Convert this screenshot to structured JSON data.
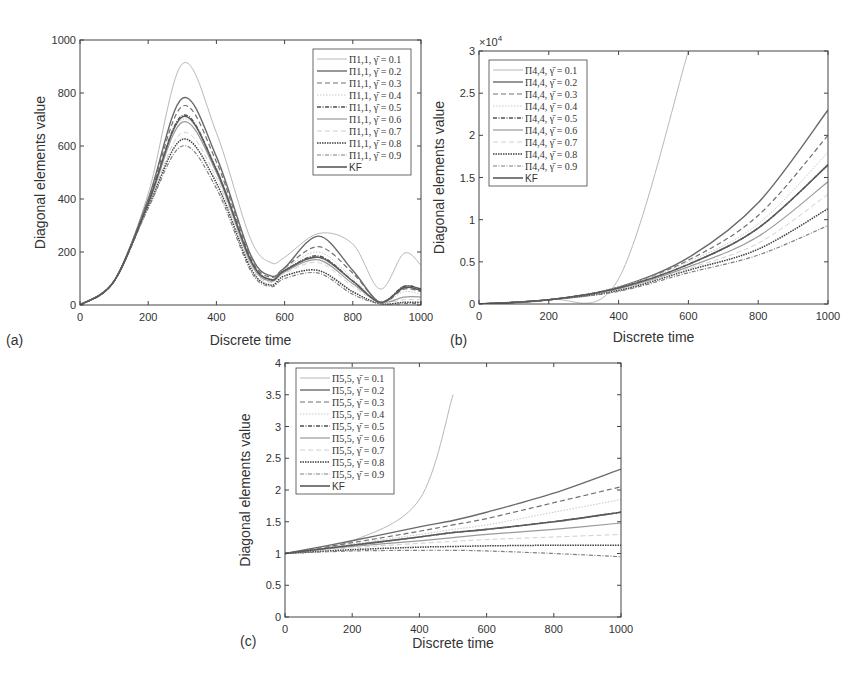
{
  "figure": {
    "panels": [
      {
        "id": "a",
        "label": "(a)",
        "xlabel": "Discrete time",
        "ylabel": "Diagonal elements value",
        "exponent": "",
        "xticks": [
          "0",
          "200",
          "400",
          "600",
          "800",
          "1000"
        ],
        "yticks": [
          "0",
          "200",
          "400",
          "600",
          "800",
          "1000"
        ],
        "legend": [
          "Π1,1, γ̄ = 0.1",
          "Π1,1, γ̄ = 0.2",
          "Π1,1, γ̄ = 0.3",
          "Π1,1, γ̄ = 0.4",
          "Π1,1, γ̄ = 0.5",
          "Π1,1, γ̄ = 0.6",
          "Π1,1, γ̄ = 0.7",
          "Π1,1, γ̄ = 0.8",
          "Π1,1, γ̄ = 0.9",
          "KF"
        ]
      },
      {
        "id": "b",
        "label": "(b)",
        "xlabel": "Discrete time",
        "ylabel": "Diagonal elements value",
        "exponent": "×10^4",
        "xticks": [
          "0",
          "200",
          "400",
          "600",
          "800",
          "1000"
        ],
        "yticks": [
          "0",
          "0.5",
          "1",
          "1.5",
          "2",
          "2.5",
          "3"
        ],
        "legend": [
          "Π4,4, γ̄ = 0.1",
          "Π4,4, γ̄ = 0.2",
          "Π4,4, γ̄ = 0.3",
          "Π4,4, γ̄ = 0.4",
          "Π4,4, γ̄ = 0.5",
          "Π4,4, γ̄ = 0.6",
          "Π4,4, γ̄ = 0.7",
          "Π4,4, γ̄ = 0.8",
          "Π4,4, γ̄ = 0.9",
          "KF"
        ]
      },
      {
        "id": "c",
        "label": "(c)",
        "xlabel": "Discrete time",
        "ylabel": "Diagonal elements value",
        "exponent": "",
        "xticks": [
          "0",
          "200",
          "400",
          "600",
          "800",
          "1000"
        ],
        "yticks": [
          "0",
          "0.5",
          "1",
          "1.5",
          "2",
          "2.5",
          "3",
          "3.5",
          "4"
        ],
        "legend": [
          "Π5,5, γ̄ = 0.1",
          "Π5,5, γ̄ = 0.2",
          "Π5,5, γ̄ = 0.3",
          "Π5,5, γ̄ = 0.4",
          "Π5,5, γ̄ = 0.5",
          "Π5,5, γ̄ = 0.6",
          "Π5,5, γ̄ = 0.7",
          "Π5,5, γ̄ = 0.8",
          "Π5,5, γ̄ = 0.9",
          "KF"
        ]
      }
    ]
  },
  "chart_data": [
    {
      "type": "line",
      "title": "(a)",
      "xlabel": "Discrete time",
      "ylabel": "Diagonal elements value",
      "xlim": [
        0,
        1000
      ],
      "ylim": [
        0,
        1000
      ],
      "grid": false,
      "legend_position": "upper right",
      "x": [
        0,
        100,
        200,
        300,
        400,
        500,
        560,
        600,
        700,
        800,
        880,
        950,
        1000
      ],
      "series": [
        {
          "name": "Π1,1, γ̄ = 0.1",
          "values": [
            0,
            90,
            420,
            910,
            650,
            250,
            160,
            180,
            270,
            230,
            60,
            195,
            150
          ]
        },
        {
          "name": "Π1,1, γ̄ = 0.2",
          "values": [
            0,
            90,
            400,
            780,
            560,
            190,
            110,
            140,
            260,
            130,
            10,
            70,
            60
          ]
        },
        {
          "name": "Π1,1, γ̄ = 0.3",
          "values": [
            0,
            90,
            395,
            750,
            540,
            180,
            105,
            140,
            220,
            120,
            10,
            60,
            50
          ]
        },
        {
          "name": "Π1,1, γ̄ = 0.4",
          "values": [
            0,
            90,
            390,
            700,
            520,
            170,
            100,
            135,
            200,
            100,
            10,
            50,
            40
          ]
        },
        {
          "name": "Π1,1, γ̄ = 0.5",
          "values": [
            0,
            90,
            385,
            715,
            510,
            170,
            95,
            130,
            185,
            90,
            10,
            70,
            60
          ]
        },
        {
          "name": "Π1,1, γ̄ = 0.6",
          "values": [
            0,
            90,
            380,
            690,
            500,
            160,
            90,
            125,
            170,
            80,
            10,
            30,
            30
          ]
        },
        {
          "name": "Π1,1, γ̄ = 0.7",
          "values": [
            0,
            90,
            375,
            650,
            480,
            150,
            85,
            120,
            160,
            70,
            10,
            20,
            20
          ]
        },
        {
          "name": "Π1,1, γ̄ = 0.8",
          "values": [
            0,
            90,
            370,
            625,
            460,
            140,
            75,
            110,
            130,
            50,
            5,
            10,
            10
          ]
        },
        {
          "name": "Π1,1, γ̄ = 0.9",
          "values": [
            0,
            90,
            365,
            600,
            440,
            130,
            70,
            100,
            120,
            40,
            5,
            5,
            5
          ]
        },
        {
          "name": "KF",
          "values": [
            0,
            90,
            385,
            710,
            510,
            170,
            95,
            130,
            180,
            90,
            10,
            65,
            55
          ]
        }
      ]
    },
    {
      "type": "line",
      "title": "(b)",
      "xlabel": "Discrete time",
      "ylabel": "Diagonal elements value",
      "y_scale": "×10^4",
      "xlim": [
        0,
        1000
      ],
      "ylim": [
        0,
        3
      ],
      "grid": false,
      "legend_position": "upper left",
      "x": [
        0,
        200,
        400,
        600,
        800,
        1000
      ],
      "series": [
        {
          "name": "Π4,4, γ̄ = 0.1",
          "values": [
            0,
            0.05,
            0.3,
            3.0,
            null,
            null
          ]
        },
        {
          "name": "Π4,4, γ̄ = 0.2",
          "values": [
            0,
            0.05,
            0.2,
            0.55,
            1.2,
            2.3
          ]
        },
        {
          "name": "Π4,4, γ̄ = 0.3",
          "values": [
            0,
            0.05,
            0.2,
            0.52,
            1.05,
            2.0
          ]
        },
        {
          "name": "Π4,4, γ̄ = 0.4",
          "values": [
            0,
            0.05,
            0.2,
            0.5,
            0.95,
            1.8
          ]
        },
        {
          "name": "Π4,4, γ̄ = 0.5",
          "values": [
            0,
            0.05,
            0.19,
            0.47,
            0.9,
            1.65
          ]
        },
        {
          "name": "Π4,4, γ̄ = 0.6",
          "values": [
            0,
            0.05,
            0.18,
            0.44,
            0.8,
            1.45
          ]
        },
        {
          "name": "Π4,4, γ̄ = 0.7",
          "values": [
            0,
            0.05,
            0.17,
            0.42,
            0.72,
            1.3
          ]
        },
        {
          "name": "Π4,4, γ̄ = 0.8",
          "values": [
            0,
            0.05,
            0.16,
            0.4,
            0.65,
            1.13
          ]
        },
        {
          "name": "Π4,4, γ̄ = 0.9",
          "values": [
            0,
            0.05,
            0.15,
            0.37,
            0.58,
            0.93
          ]
        },
        {
          "name": "KF",
          "values": [
            0,
            0.05,
            0.19,
            0.47,
            0.9,
            1.65
          ]
        }
      ]
    },
    {
      "type": "line",
      "title": "(c)",
      "xlabel": "Discrete time",
      "ylabel": "Diagonal elements value",
      "xlim": [
        0,
        1000
      ],
      "ylim": [
        0,
        4
      ],
      "grid": false,
      "legend_position": "upper left",
      "x": [
        0,
        200,
        400,
        500,
        600,
        800,
        1000
      ],
      "series": [
        {
          "name": "Π5,5, γ̄ = 0.1",
          "values": [
            1.0,
            1.2,
            1.85,
            3.5,
            null,
            null,
            null
          ]
        },
        {
          "name": "Π5,5, γ̄ = 0.2",
          "values": [
            1.0,
            1.2,
            1.42,
            1.52,
            1.65,
            1.95,
            2.33
          ]
        },
        {
          "name": "Π5,5, γ̄ = 0.3",
          "values": [
            1.0,
            1.17,
            1.35,
            1.45,
            1.55,
            1.8,
            2.05
          ]
        },
        {
          "name": "Π5,5, γ̄ = 0.4",
          "values": [
            1.0,
            1.15,
            1.3,
            1.38,
            1.45,
            1.65,
            1.85
          ]
        },
        {
          "name": "Π5,5, γ̄ = 0.5",
          "values": [
            1.0,
            1.13,
            1.26,
            1.33,
            1.38,
            1.5,
            1.65
          ]
        },
        {
          "name": "Π5,5, γ̄ = 0.6",
          "values": [
            1.0,
            1.11,
            1.2,
            1.25,
            1.3,
            1.38,
            1.48
          ]
        },
        {
          "name": "Π5,5, γ̄ = 0.7",
          "values": [
            1.0,
            1.09,
            1.16,
            1.19,
            1.22,
            1.26,
            1.3
          ]
        },
        {
          "name": "Π5,5, γ̄ = 0.8",
          "values": [
            1.0,
            1.06,
            1.1,
            1.11,
            1.12,
            1.13,
            1.13
          ]
        },
        {
          "name": "Π5,5, γ̄ = 0.9",
          "values": [
            1.0,
            1.04,
            1.05,
            1.05,
            1.04,
            1.0,
            0.95
          ]
        },
        {
          "name": "KF",
          "values": [
            1.0,
            1.13,
            1.26,
            1.33,
            1.38,
            1.5,
            1.65
          ]
        }
      ]
    }
  ]
}
